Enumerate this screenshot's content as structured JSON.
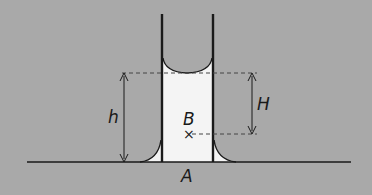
{
  "diagram": {
    "labels": {
      "h": "h",
      "H": "H",
      "B": "B",
      "A": "A"
    },
    "point_marker": "×",
    "colors": {
      "background": "#a9a9a9",
      "liquid": "#f4f4f4",
      "lines": "#1a1a1a",
      "dashed": "#444444"
    }
  }
}
